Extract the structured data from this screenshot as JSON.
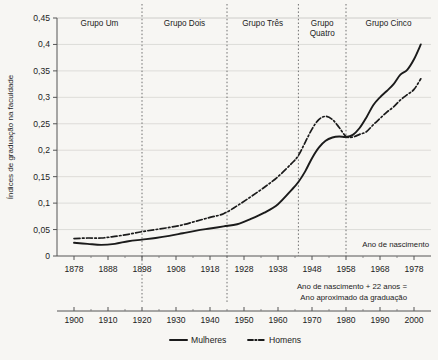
{
  "chart_data": {
    "type": "line",
    "title": "",
    "xlabel": "Ano de nascimento",
    "ylabel": "Índices de graduação na faculdade",
    "xlim": [
      1873,
      1983
    ],
    "ylim": [
      0,
      0.45
    ],
    "grid": true,
    "legend_position": "bottom",
    "y_ticks": [
      "0",
      "0,05",
      "0,1",
      "0,15",
      "0,2",
      "0,25",
      "0,3",
      "0,35",
      "0,4",
      "0,45"
    ],
    "y_tick_values": [
      0,
      0.05,
      0.1,
      0.15,
      0.2,
      0.25,
      0.3,
      0.35,
      0.4,
      0.45
    ],
    "x_ticks": [
      "1878",
      "1888",
      "1898",
      "1908",
      "1918",
      "1928",
      "1938",
      "1948",
      "1958",
      "1968",
      "1978"
    ],
    "x_tick_values": [
      1878,
      1888,
      1898,
      1908,
      1918,
      1928,
      1938,
      1948,
      1958,
      1968,
      1978
    ],
    "secondary_axis": {
      "label": "Ano de nascimento + 22 anos =\nAno aproximado da graduação",
      "label_line1": "Ano de nascimento + 22 anos =",
      "label_line2": "Ano aproximado da graduação",
      "ticks": [
        "1900",
        "1910",
        "1920",
        "1930",
        "1940",
        "1950",
        "1960",
        "1970",
        "1980",
        "1990",
        "2000"
      ],
      "tick_values": [
        1900,
        1910,
        1920,
        1930,
        1940,
        1950,
        1960,
        1970,
        1980,
        1990,
        2000
      ]
    },
    "group_bands": [
      {
        "label": "Grupo Um",
        "label_line1": "Grupo Um",
        "label_line2": "",
        "start": 1873,
        "end": 1898
      },
      {
        "label": "Grupo Dois",
        "label_line1": "Grupo Dois",
        "label_line2": "",
        "start": 1898,
        "end": 1923
      },
      {
        "label": "Grupo Três",
        "label_line1": "Grupo Três",
        "label_line2": "",
        "start": 1923,
        "end": 1944
      },
      {
        "label": "Grupo Quatro",
        "label_line1": "Grupo",
        "label_line2": "Quatro",
        "start": 1944,
        "end": 1958
      },
      {
        "label": "Grupo Cinco",
        "label_line1": "Grupo Cinco",
        "label_line2": "",
        "start": 1958,
        "end": 1983
      }
    ],
    "x": [
      1878,
      1882,
      1886,
      1890,
      1894,
      1898,
      1902,
      1906,
      1910,
      1914,
      1918,
      1922,
      1926,
      1930,
      1934,
      1938,
      1942,
      1944,
      1946,
      1948,
      1950,
      1952,
      1954,
      1956,
      1958,
      1960,
      1962,
      1964,
      1966,
      1968,
      1970,
      1972,
      1974,
      1976,
      1978,
      1980
    ],
    "series": [
      {
        "name": "Mulheres",
        "style": "solid",
        "color": "#1b1b1b",
        "values": [
          0.025,
          0.023,
          0.021,
          0.023,
          0.028,
          0.031,
          0.034,
          0.038,
          0.043,
          0.048,
          0.052,
          0.056,
          0.06,
          0.07,
          0.082,
          0.098,
          0.125,
          0.14,
          0.16,
          0.185,
          0.205,
          0.218,
          0.224,
          0.226,
          0.225,
          0.229,
          0.242,
          0.262,
          0.285,
          0.3,
          0.312,
          0.325,
          0.343,
          0.352,
          0.372,
          0.4
        ]
      },
      {
        "name": "Homens",
        "style": "dashdot",
        "color": "#1b1b1b",
        "values": [
          0.033,
          0.034,
          0.034,
          0.037,
          0.041,
          0.046,
          0.05,
          0.054,
          0.059,
          0.066,
          0.073,
          0.08,
          0.095,
          0.112,
          0.13,
          0.15,
          0.175,
          0.19,
          0.215,
          0.24,
          0.258,
          0.264,
          0.258,
          0.243,
          0.226,
          0.225,
          0.23,
          0.235,
          0.248,
          0.26,
          0.272,
          0.282,
          0.295,
          0.305,
          0.315,
          0.335
        ]
      }
    ],
    "legend": [
      {
        "label": "Mulheres",
        "style": "solid"
      },
      {
        "label": "Homens",
        "style": "dashdot"
      }
    ]
  }
}
